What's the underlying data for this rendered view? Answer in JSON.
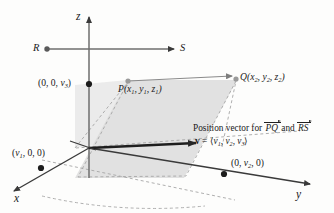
{
  "figure": {
    "background_color": "#fdfdfc",
    "line_color": "#3a3a3a",
    "dash_color": "#9a9a9a",
    "plane_fill": "#d8d8d8"
  },
  "axes": {
    "z_label": "z",
    "x_label": "x",
    "y_label": "y"
  },
  "points": {
    "R_label": "R",
    "S_label": "S",
    "P_label": "P",
    "P_coords": {
      "x": "x",
      "x_sub": "1",
      "y": "y",
      "y_sub": "1",
      "z": "z",
      "z_sub": "1"
    },
    "Q_label": "Q",
    "Q_coords": {
      "x": "x",
      "x_sub": "2",
      "y": "y",
      "y_sub": "2",
      "z": "z",
      "z_sub": "2"
    }
  },
  "intercepts": {
    "z_axis": {
      "prefix": "(0, 0, ",
      "var": "v",
      "sub": "3",
      "suffix": ")"
    },
    "x_axis": {
      "prefix": "(",
      "var": "v",
      "sub": "1",
      "suffix": ", 0, 0)"
    },
    "y_axis": {
      "prefix": "(0, ",
      "var": "v",
      "sub": "2",
      "suffix": ", 0)"
    }
  },
  "annotation": {
    "line1_prefix": "Position vector for ",
    "vector_pq": "PQ",
    "line1_join": " and ",
    "vector_rs": "RS",
    "line2_lhs": "v",
    "line2_eq": " = ",
    "line2_open": "⟨",
    "line2_v1": "v",
    "line2_v1_sub": "1",
    "line2_c1": ", ",
    "line2_v2": "v",
    "line2_v2_sub": "2",
    "line2_c2": ", ",
    "line2_v3": "v",
    "line2_v3_sub": "3",
    "line2_close": "⟩"
  }
}
